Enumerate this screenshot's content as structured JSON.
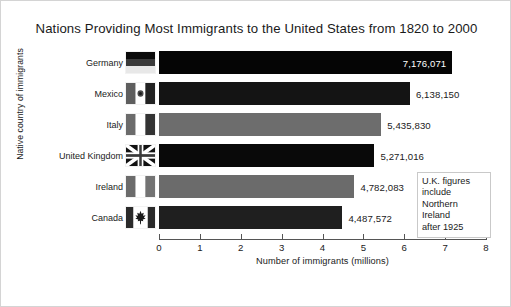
{
  "chart_data": {
    "type": "bar",
    "orientation": "horizontal",
    "title": "Nations Providing Most Immigrants to the United States from 1820 to 2000",
    "xlabel": "Number of immigrants (millions)",
    "ylabel": "Native country of immigrants",
    "xlim": [
      0,
      8
    ],
    "xticks": [
      "0",
      "1",
      "2",
      "3",
      "4",
      "5",
      "6",
      "7",
      "8"
    ],
    "grid": false,
    "legend": "none",
    "categories": [
      "Germany",
      "Mexico",
      "Italy",
      "United Kingdom",
      "Ireland",
      "Canada"
    ],
    "values": [
      7176071,
      6138150,
      5435830,
      5271016,
      4782083,
      4487572
    ],
    "value_labels": [
      "7,176,071",
      "6,138,150",
      "5,435,830",
      "5,271,016",
      "4,782,083",
      "4,487,572"
    ],
    "bars": [
      {
        "category": "Germany",
        "value": 7176071,
        "label": "7,176,071",
        "color": "#050505",
        "label_position": "inside",
        "flag": "flag-germany"
      },
      {
        "category": "Mexico",
        "value": 6138150,
        "label": "6,138,150",
        "color": "#141414",
        "label_position": "outside",
        "flag": "flag-mexico"
      },
      {
        "category": "Italy",
        "value": 5435830,
        "label": "5,435,830",
        "color": "#6d6d6d",
        "label_position": "outside",
        "flag": "flag-italy"
      },
      {
        "category": "United Kingdom",
        "value": 5271016,
        "label": "5,271,016",
        "color": "#090909",
        "label_position": "outside",
        "flag": "flag-united-kingdom"
      },
      {
        "category": "Ireland",
        "value": 4782083,
        "label": "4,782,083",
        "color": "#6b6b6b",
        "label_position": "outside",
        "flag": "flag-ireland"
      },
      {
        "category": "Canada",
        "value": 4487572,
        "label": "4,487,572",
        "color": "#1f1f1f",
        "label_position": "outside",
        "flag": "flag-canada"
      }
    ],
    "annotation": {
      "lines": [
        "U.K. figures",
        "include",
        "Northern",
        "Ireland",
        "after 1925"
      ]
    }
  }
}
